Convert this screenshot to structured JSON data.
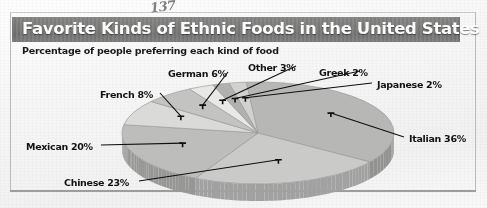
{
  "figure": {
    "pencil_annotation": "137",
    "title": "Favorite Kinds of Ethnic Foods in the United States",
    "subtitle": "Percentage of people preferring each kind of food",
    "colors": {
      "banner_background": "#7d7d7a",
      "banner_text": "#ffffff",
      "page_background": "#f4f4f2",
      "label_text": "#141414",
      "slice_light": "#d6d6d2",
      "slice_medium": "#bdbdb8",
      "slice_dark": "#a8a8a3",
      "slice_pale": "#e8e8e4",
      "leader_line": "#111111"
    }
  },
  "chart_data": {
    "type": "pie",
    "title": "Favorite Kinds of Ethnic Foods in the United States",
    "subtitle": "Percentage of people preferring each kind of food",
    "xlabel": "",
    "ylabel": "",
    "units": "percent",
    "total": 100,
    "three_d": true,
    "legend": "none",
    "grid": false,
    "categories": [
      "Italian",
      "Chinese",
      "Mexican",
      "French",
      "German",
      "Other",
      "Greek",
      "Japanese"
    ],
    "values": [
      36,
      23,
      20,
      8,
      6,
      3,
      2,
      2
    ],
    "labels": [
      "Italian 36%",
      "Chinese 23%",
      "Mexican 20%",
      "French 8%",
      "German 6%",
      "Other 3%",
      "Greek 2%",
      "Japanese 2%"
    ],
    "slices": [
      {
        "name": "Italian",
        "label": "Italian 36%",
        "value": 36,
        "fill": "#b6b6b1"
      },
      {
        "name": "Chinese",
        "label": "Chinese 23%",
        "value": 23,
        "fill": "#c9c9c4"
      },
      {
        "name": "Mexican",
        "label": "Mexican 20%",
        "value": 20,
        "fill": "#bcbcb7"
      },
      {
        "name": "French",
        "label": "French 8%",
        "value": 8,
        "fill": "#d8d8d4"
      },
      {
        "name": "German",
        "label": "German 6%",
        "value": 6,
        "fill": "#c2c2bd"
      },
      {
        "name": "Other",
        "label": "Other 3%",
        "value": 3,
        "fill": "#e6e6e2"
      },
      {
        "name": "Greek",
        "label": "Greek 2%",
        "value": 2,
        "fill": "#b0b0ab"
      },
      {
        "name": "Japanese",
        "label": "Japanese 2%",
        "value": 2,
        "fill": "#d0d0cb"
      }
    ]
  },
  "label_positions": {
    "italian": {
      "left": 409,
      "top": 133
    },
    "chinese": {
      "left": 64,
      "top": 177
    },
    "mexican": {
      "left": 26,
      "top": 141
    },
    "french": {
      "left": 100,
      "top": 89
    },
    "german": {
      "left": 168,
      "top": 68
    },
    "other": {
      "left": 248,
      "top": 62
    },
    "greek": {
      "left": 319,
      "top": 67
    },
    "japanese": {
      "left": 377,
      "top": 79
    }
  }
}
